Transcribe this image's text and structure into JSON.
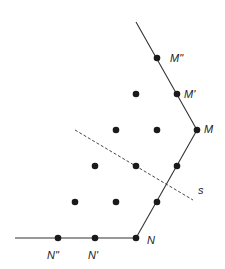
{
  "diagram": {
    "labels": {
      "M2": "M\"",
      "M1": "M'",
      "M": "M",
      "N": "N",
      "N1": "N'",
      "N2": "N\"",
      "s": "s"
    },
    "colors": {
      "line": "#333333",
      "dot": "#1a1a1a",
      "text": "#222222"
    }
  }
}
